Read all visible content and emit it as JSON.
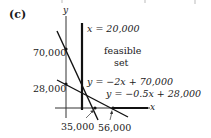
{
  "panel_label": "(c)",
  "axes": {
    "x_label": "x",
    "y_label": "y"
  },
  "y_ticks": [
    "70,000",
    "28,000"
  ],
  "x_ticks": [
    "35,000",
    "56,000"
  ],
  "lines": [
    {
      "label": "x = 20,000"
    },
    {
      "label": "y = −2x + 70,000"
    },
    {
      "label": "y = −0.5x + 28,000"
    }
  ],
  "region_label_line1": "feasible",
  "region_label_line2": "set"
}
